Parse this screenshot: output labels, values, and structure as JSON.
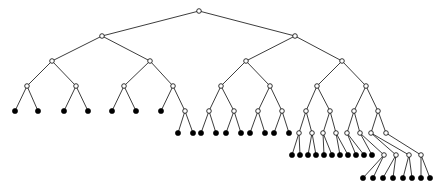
{
  "figure": {
    "width": 436,
    "height": 196,
    "background_color": "#ffffff"
  },
  "style": {
    "edge_color": "#1a1a1a",
    "edge_width": 0.85,
    "internal_node_fill": "#ffffff",
    "internal_node_stroke": "#111111",
    "leaf_node_fill": "#000000",
    "internal_node_radius": 2.3,
    "leaf_node_radius": 2.6
  },
  "chart_data": {
    "type": "diagram",
    "subtype": "tree",
    "node_count": 123,
    "leaf_count": 62,
    "internal_count": 61,
    "max_depth": 7,
    "level_y": [
      11,
      36,
      61,
      86,
      111,
      133,
      155,
      178
    ],
    "levels": [
      {
        "depth": 0,
        "internal": 1,
        "leaves": 0
      },
      {
        "depth": 1,
        "internal": 2,
        "leaves": 0
      },
      {
        "depth": 2,
        "internal": 4,
        "leaves": 0
      },
      {
        "depth": 3,
        "internal": 8,
        "leaves": 0
      },
      {
        "depth": 4,
        "internal": 15,
        "leaves": 7
      },
      {
        "depth": 5,
        "internal": 16,
        "leaves": 23
      },
      {
        "depth": 6,
        "internal": 4,
        "leaves": 24
      },
      {
        "depth": 7,
        "internal": 0,
        "leaves": 8
      }
    ],
    "nodes": [
      {
        "id": "n0",
        "x": 199,
        "y": 11,
        "kind": "internal",
        "depth": 0
      },
      {
        "id": "n1",
        "x": 102,
        "y": 36,
        "kind": "internal",
        "depth": 1
      },
      {
        "id": "n2",
        "x": 295,
        "y": 36,
        "kind": "internal",
        "depth": 1
      },
      {
        "id": "n3",
        "x": 52,
        "y": 61,
        "kind": "internal",
        "depth": 2
      },
      {
        "id": "n4",
        "x": 150,
        "y": 61,
        "kind": "internal",
        "depth": 2
      },
      {
        "id": "n5",
        "x": 246,
        "y": 61,
        "kind": "internal",
        "depth": 2
      },
      {
        "id": "n6",
        "x": 342,
        "y": 61,
        "kind": "internal",
        "depth": 2
      },
      {
        "id": "n7",
        "x": 27,
        "y": 86,
        "kind": "internal",
        "depth": 3
      },
      {
        "id": "n8",
        "x": 76,
        "y": 86,
        "kind": "internal",
        "depth": 3
      },
      {
        "id": "n9",
        "x": 124,
        "y": 86,
        "kind": "internal",
        "depth": 3
      },
      {
        "id": "n10",
        "x": 173,
        "y": 86,
        "kind": "internal",
        "depth": 3
      },
      {
        "id": "n11",
        "x": 221,
        "y": 86,
        "kind": "internal",
        "depth": 3
      },
      {
        "id": "n12",
        "x": 270,
        "y": 86,
        "kind": "internal",
        "depth": 3
      },
      {
        "id": "n13",
        "x": 317,
        "y": 86,
        "kind": "internal",
        "depth": 3
      },
      {
        "id": "n14",
        "x": 366,
        "y": 86,
        "kind": "internal",
        "depth": 3
      },
      {
        "id": "n15",
        "x": 15,
        "y": 111,
        "kind": "leaf",
        "depth": 4
      },
      {
        "id": "n16",
        "x": 38,
        "y": 111,
        "kind": "leaf",
        "depth": 4
      },
      {
        "id": "n17",
        "x": 64,
        "y": 111,
        "kind": "leaf",
        "depth": 4
      },
      {
        "id": "n18",
        "x": 88,
        "y": 111,
        "kind": "leaf",
        "depth": 4
      },
      {
        "id": "n19",
        "x": 112,
        "y": 111,
        "kind": "leaf",
        "depth": 4
      },
      {
        "id": "n20",
        "x": 136,
        "y": 111,
        "kind": "leaf",
        "depth": 4
      },
      {
        "id": "n21",
        "x": 161,
        "y": 111,
        "kind": "leaf",
        "depth": 4
      },
      {
        "id": "n22",
        "x": 185,
        "y": 111,
        "kind": "internal",
        "depth": 4
      },
      {
        "id": "n23",
        "x": 209,
        "y": 111,
        "kind": "internal",
        "depth": 4
      },
      {
        "id": "n24",
        "x": 234,
        "y": 111,
        "kind": "internal",
        "depth": 4
      },
      {
        "id": "n25",
        "x": 258,
        "y": 111,
        "kind": "internal",
        "depth": 4
      },
      {
        "id": "n26",
        "x": 282,
        "y": 111,
        "kind": "internal",
        "depth": 4
      },
      {
        "id": "n27",
        "x": 306,
        "y": 111,
        "kind": "internal",
        "depth": 4
      },
      {
        "id": "n28",
        "x": 330,
        "y": 111,
        "kind": "internal",
        "depth": 4
      },
      {
        "id": "n29",
        "x": 354,
        "y": 111,
        "kind": "internal",
        "depth": 4
      },
      {
        "id": "n30",
        "x": 378,
        "y": 111,
        "kind": "internal",
        "depth": 4
      },
      {
        "id": "n31",
        "x": 178,
        "y": 133,
        "kind": "leaf",
        "depth": 5
      },
      {
        "id": "n32",
        "x": 193,
        "y": 133,
        "kind": "leaf",
        "depth": 5
      },
      {
        "id": "n33",
        "x": 201,
        "y": 133,
        "kind": "leaf",
        "depth": 5
      },
      {
        "id": "n34",
        "x": 216,
        "y": 133,
        "kind": "leaf",
        "depth": 5
      },
      {
        "id": "n35",
        "x": 226,
        "y": 133,
        "kind": "leaf",
        "depth": 5
      },
      {
        "id": "n36",
        "x": 241,
        "y": 133,
        "kind": "leaf",
        "depth": 5
      },
      {
        "id": "n37",
        "x": 250,
        "y": 133,
        "kind": "leaf",
        "depth": 5
      },
      {
        "id": "n38",
        "x": 265,
        "y": 133,
        "kind": "leaf",
        "depth": 5
      },
      {
        "id": "n39",
        "x": 274,
        "y": 133,
        "kind": "leaf",
        "depth": 5
      },
      {
        "id": "n40",
        "x": 289,
        "y": 133,
        "kind": "leaf",
        "depth": 5
      },
      {
        "id": "n41",
        "x": 299,
        "y": 133,
        "kind": "internal",
        "depth": 5
      },
      {
        "id": "n42",
        "x": 312,
        "y": 133,
        "kind": "internal",
        "depth": 5
      },
      {
        "id": "n43",
        "x": 323,
        "y": 133,
        "kind": "internal",
        "depth": 5
      },
      {
        "id": "n44",
        "x": 336,
        "y": 133,
        "kind": "internal",
        "depth": 5
      },
      {
        "id": "n45",
        "x": 347,
        "y": 133,
        "kind": "internal",
        "depth": 5
      },
      {
        "id": "n46",
        "x": 360,
        "y": 133,
        "kind": "internal",
        "depth": 5
      },
      {
        "id": "n47",
        "x": 371,
        "y": 133,
        "kind": "internal",
        "depth": 5
      },
      {
        "id": "n48",
        "x": 386,
        "y": 133,
        "kind": "internal",
        "depth": 5
      },
      {
        "id": "n49",
        "x": 292,
        "y": 155,
        "kind": "leaf",
        "depth": 6
      },
      {
        "id": "n50",
        "x": 300,
        "y": 155,
        "kind": "leaf",
        "depth": 6
      },
      {
        "id": "n51",
        "x": 308,
        "y": 155,
        "kind": "leaf",
        "depth": 6
      },
      {
        "id": "n52",
        "x": 316,
        "y": 155,
        "kind": "leaf",
        "depth": 6
      },
      {
        "id": "n53",
        "x": 324,
        "y": 155,
        "kind": "leaf",
        "depth": 6
      },
      {
        "id": "n54",
        "x": 332,
        "y": 155,
        "kind": "leaf",
        "depth": 6
      },
      {
        "id": "n55",
        "x": 340,
        "y": 155,
        "kind": "leaf",
        "depth": 6
      },
      {
        "id": "n56",
        "x": 348,
        "y": 155,
        "kind": "leaf",
        "depth": 6
      },
      {
        "id": "n57",
        "x": 356,
        "y": 155,
        "kind": "leaf",
        "depth": 6
      },
      {
        "id": "n58",
        "x": 364,
        "y": 155,
        "kind": "leaf",
        "depth": 6
      },
      {
        "id": "n59",
        "x": 372,
        "y": 155,
        "kind": "leaf",
        "depth": 6
      },
      {
        "id": "n60",
        "x": 384,
        "y": 155,
        "kind": "internal",
        "depth": 6
      },
      {
        "id": "n61",
        "x": 396,
        "y": 155,
        "kind": "internal",
        "depth": 6
      },
      {
        "id": "n62",
        "x": 409,
        "y": 155,
        "kind": "internal",
        "depth": 6
      },
      {
        "id": "n63",
        "x": 421,
        "y": 155,
        "kind": "internal",
        "depth": 6
      },
      {
        "id": "n64",
        "x": 363,
        "y": 178,
        "kind": "leaf",
        "depth": 7
      },
      {
        "id": "n65",
        "x": 373,
        "y": 178,
        "kind": "leaf",
        "depth": 7
      },
      {
        "id": "n66",
        "x": 383,
        "y": 178,
        "kind": "leaf",
        "depth": 7
      },
      {
        "id": "n67",
        "x": 393,
        "y": 178,
        "kind": "leaf",
        "depth": 7
      },
      {
        "id": "n68",
        "x": 403,
        "y": 178,
        "kind": "leaf",
        "depth": 7
      },
      {
        "id": "n69",
        "x": 412,
        "y": 178,
        "kind": "leaf",
        "depth": 7
      },
      {
        "id": "n70",
        "x": 421,
        "y": 178,
        "kind": "leaf",
        "depth": 7
      },
      {
        "id": "n71",
        "x": 430,
        "y": 178,
        "kind": "leaf",
        "depth": 7
      }
    ],
    "edges": [
      [
        "n0",
        "n1"
      ],
      [
        "n0",
        "n2"
      ],
      [
        "n1",
        "n3"
      ],
      [
        "n1",
        "n4"
      ],
      [
        "n2",
        "n5"
      ],
      [
        "n2",
        "n6"
      ],
      [
        "n3",
        "n7"
      ],
      [
        "n3",
        "n8"
      ],
      [
        "n4",
        "n9"
      ],
      [
        "n4",
        "n10"
      ],
      [
        "n5",
        "n11"
      ],
      [
        "n5",
        "n12"
      ],
      [
        "n6",
        "n13"
      ],
      [
        "n6",
        "n14"
      ],
      [
        "n7",
        "n15"
      ],
      [
        "n7",
        "n16"
      ],
      [
        "n8",
        "n17"
      ],
      [
        "n8",
        "n18"
      ],
      [
        "n9",
        "n19"
      ],
      [
        "n9",
        "n20"
      ],
      [
        "n10",
        "n21"
      ],
      [
        "n10",
        "n22"
      ],
      [
        "n11",
        "n23"
      ],
      [
        "n11",
        "n24"
      ],
      [
        "n12",
        "n25"
      ],
      [
        "n12",
        "n26"
      ],
      [
        "n13",
        "n27"
      ],
      [
        "n13",
        "n28"
      ],
      [
        "n14",
        "n29"
      ],
      [
        "n14",
        "n30"
      ],
      [
        "n22",
        "n31"
      ],
      [
        "n22",
        "n32"
      ],
      [
        "n23",
        "n33"
      ],
      [
        "n23",
        "n34"
      ],
      [
        "n24",
        "n35"
      ],
      [
        "n24",
        "n36"
      ],
      [
        "n25",
        "n37"
      ],
      [
        "n25",
        "n38"
      ],
      [
        "n26",
        "n39"
      ],
      [
        "n26",
        "n40"
      ],
      [
        "n27",
        "n41"
      ],
      [
        "n27",
        "n42"
      ],
      [
        "n28",
        "n43"
      ],
      [
        "n28",
        "n44"
      ],
      [
        "n29",
        "n45"
      ],
      [
        "n29",
        "n46"
      ],
      [
        "n30",
        "n47"
      ],
      [
        "n30",
        "n48"
      ],
      [
        "n41",
        "n49"
      ],
      [
        "n41",
        "n50"
      ],
      [
        "n42",
        "n51"
      ],
      [
        "n42",
        "n52"
      ],
      [
        "n43",
        "n53"
      ],
      [
        "n43",
        "n54"
      ],
      [
        "n44",
        "n55"
      ],
      [
        "n44",
        "n56"
      ],
      [
        "n45",
        "n57"
      ],
      [
        "n45",
        "n58"
      ],
      [
        "n46",
        "n59"
      ],
      [
        "n46",
        "n60"
      ],
      [
        "n47",
        "n61"
      ],
      [
        "n47",
        "n62"
      ],
      [
        "n48",
        "n63"
      ],
      [
        "n60",
        "n64"
      ],
      [
        "n60",
        "n65"
      ],
      [
        "n61",
        "n66"
      ],
      [
        "n61",
        "n67"
      ],
      [
        "n62",
        "n68"
      ],
      [
        "n62",
        "n69"
      ],
      [
        "n63",
        "n70"
      ],
      [
        "n63",
        "n71"
      ]
    ]
  }
}
